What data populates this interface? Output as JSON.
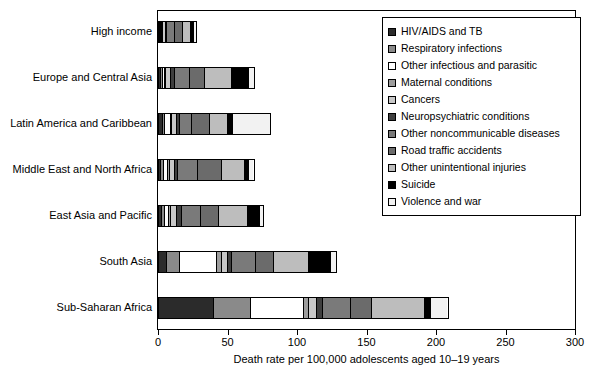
{
  "chart_data": {
    "type": "bar",
    "orientation": "horizontal",
    "stacked": true,
    "title": "",
    "xlabel": "Death rate per 100,000 adolescents aged 10–19 years",
    "ylabel": "",
    "xlim": [
      0,
      300
    ],
    "xticks": [
      0,
      50,
      100,
      150,
      200,
      250,
      300
    ],
    "xticklabels": [
      "0",
      "50",
      "100",
      "150",
      "200",
      "250",
      "300"
    ],
    "grid": false,
    "legend_position": "upper right",
    "categories": [
      "High income",
      "Europe and Central Asia",
      "Latin America and Caribbean",
      "Middle East and North Africa",
      "East Asia and Pacific",
      "South Asia",
      "Sub-Saharan Africa"
    ],
    "series": [
      {
        "name": "HIV/AIDS and TB",
        "color": "#2b2b2b",
        "values": [
          0.6,
          1.5,
          3.0,
          1.5,
          2.0,
          5.5,
          40.0
        ]
      },
      {
        "name": "Respiratory infections",
        "color": "#8a8a8a",
        "values": [
          0.7,
          1.5,
          1.5,
          2.0,
          2.5,
          10.0,
          27.0
        ]
      },
      {
        "name": "Other infectious and parasitic",
        "color": "#ffffff",
        "values": [
          0.5,
          1.5,
          4.0,
          3.0,
          2.5,
          27.0,
          38.0
        ]
      },
      {
        "name": "Maternal conditions",
        "color": "#9d9d9d",
        "values": [
          0.3,
          1.0,
          1.0,
          1.5,
          2.0,
          3.5,
          3.5
        ]
      },
      {
        "name": "Cancers",
        "color": "#c8c8c8",
        "values": [
          2.0,
          3.5,
          3.5,
          3.5,
          4.0,
          4.5,
          6.0
        ]
      },
      {
        "name": "Neuropsychiatric conditions",
        "color": "#3f3f3f",
        "values": [
          1.2,
          2.5,
          2.5,
          2.5,
          4.0,
          3.0,
          4.5
        ]
      },
      {
        "name": "Other noncommunicable diseases",
        "color": "#7a7a7a",
        "values": [
          6.0,
          11.0,
          9.0,
          15.0,
          14.0,
          17.0,
          20.0
        ]
      },
      {
        "name": "Road traffic accidents",
        "color": "#6b6b6b",
        "values": [
          6.5,
          11.0,
          13.0,
          17.0,
          13.0,
          13.0,
          15.0
        ]
      },
      {
        "name": "Other unintentional injuries",
        "color": "#bdbdbd",
        "values": [
          6.0,
          20.0,
          13.0,
          17.0,
          21.0,
          26.0,
          39.0
        ]
      },
      {
        "name": "Suicide",
        "color": "#000000",
        "values": [
          3.0,
          13.0,
          4.0,
          3.0,
          9.0,
          16.0,
          4.0
        ]
      },
      {
        "name": "Violence and war",
        "color": "#f2f2f2",
        "values": [
          1.2,
          3.0,
          26.5,
          3.5,
          2.0,
          3.5,
          12.0
        ]
      }
    ],
    "totals": [
      28.0,
      69.5,
      81.0,
      69.5,
      76.0,
      129.0,
      209.0
    ]
  }
}
